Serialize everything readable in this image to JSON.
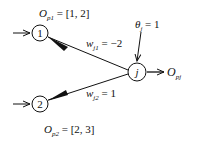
{
  "diagram": {
    "nodes": [
      {
        "id": "1",
        "label": "1",
        "output_label_main": "O",
        "output_label_sub": "p1",
        "output_value": " = [1, 2]"
      },
      {
        "id": "2",
        "label": "2",
        "output_label_main": "O",
        "output_label_sub": "p2",
        "output_value": " = [2, 3]"
      },
      {
        "id": "j",
        "label": "j",
        "output_label_main": "O",
        "output_label_sub": "pj"
      }
    ],
    "edges": [
      {
        "from": "1",
        "to": "j",
        "weight_main": "w",
        "weight_sub": "j1",
        "weight_value": " = −2"
      },
      {
        "from": "2",
        "to": "j",
        "weight_main": "w",
        "weight_sub": "j2",
        "weight_value": " = 1"
      }
    ],
    "bias": {
      "main": "θ",
      "sub": "j",
      "value": " = 1"
    }
  }
}
